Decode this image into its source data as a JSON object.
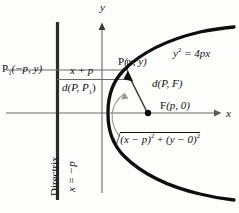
{
  "figure": {
    "type": "geometry-diagram",
    "background_color": "#fdfdfc",
    "ink_color": "#111111",
    "curve_color": "#000000",
    "thin_line_color": "#6a6a6a",
    "arrow_color": "#8a8a8a"
  },
  "axes": {
    "x_label": "x",
    "y_label": "y",
    "origin_px": {
      "x": 102,
      "y": 113
    },
    "x_axis_y_px": 113,
    "y_axis_x_px": 102
  },
  "labels": {
    "p1_point": "P₁(−p, y)",
    "p1_main": "P",
    "p1_sub": "1",
    "p1_args": "(−p, y)",
    "x_plus_p": "x + p",
    "distance_p_p1": "d(P, P₁)",
    "distance_p_p1_main": "d(P, P",
    "distance_p_p1_sub": "1",
    "distance_p_p1_close": ")",
    "point_p": "P(x, y)",
    "point_p_rm": "P",
    "point_p_args": "(x, y)",
    "parabola_equation": "y² = 4px",
    "parabola_eq_base": "y",
    "parabola_eq_exp": "2",
    "parabola_eq_rest": " = 4px",
    "distance_p_f": "d(P, F)",
    "focus_point": "F(p, 0)",
    "focus_rm": "F",
    "focus_args": "(p, 0)",
    "directrix": "Directrix",
    "directrix_equation": "x = −p",
    "radical_expression": "√((x − p)² + (y − 0)²)",
    "radical_sign": "√",
    "radical_term1_open": "(x − p)",
    "radical_term1_exp": "2",
    "radical_plus": " + ",
    "radical_term2_open": "(y − 0)",
    "radical_term2_exp": "2"
  },
  "geometry": {
    "directrix_line": {
      "x": 57,
      "y_top": 22,
      "y_bottom": 200
    },
    "y_axis_line": {
      "x": 102,
      "y_top": 30,
      "y_bottom": 193
    },
    "x_axis_line": {
      "y": 113,
      "x_left": 6,
      "x_right": 219
    },
    "horizontal_line_to_p": {
      "y": 70,
      "x_left": 6,
      "x_right": 128
    },
    "box_divider_line": {
      "y": 79,
      "x_left": 57,
      "x_right": 128
    },
    "point_p_px": {
      "x": 128,
      "y": 73
    },
    "focus_px": {
      "x": 148,
      "y": 113
    },
    "vertex_px": {
      "x": 108,
      "y": 112
    },
    "focal_radius_segment": {
      "x1": 128,
      "y1": 73,
      "x2": 148,
      "y2": 113
    },
    "curve_arrow": {
      "from_x": 120,
      "from_y": 136,
      "to_x": 132,
      "to_y": 92
    }
  }
}
